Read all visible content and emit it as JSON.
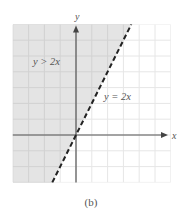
{
  "chart_data": {
    "type": "line",
    "title": "",
    "caption": "(b)",
    "xlabel": "x",
    "ylabel": "y",
    "xlim": [
      -4,
      6
    ],
    "ylim": [
      -3,
      7
    ],
    "grid": true,
    "grid_step": 1,
    "series": [
      {
        "name": "y = 2x",
        "style": "dashed",
        "color": "#222222",
        "points": [
          [
            -1.5,
            -3
          ],
          [
            3.5,
            7
          ]
        ]
      }
    ],
    "shaded_region": {
      "label": "y > 2x",
      "description": "region above (left of) the boundary line",
      "fill": "#e4e4e4",
      "boundary_inclusive": false
    },
    "annotations": [
      {
        "text": "y > 2x",
        "x": -2.5,
        "y": 4.7
      },
      {
        "text": "y = 2x",
        "x": 2.6,
        "y": 2.4
      }
    ]
  },
  "labels": {
    "x_axis": "x",
    "y_axis": "y",
    "inequality": "y > 2x",
    "equation": "y = 2x",
    "caption": "(b)"
  },
  "colors": {
    "shade": "#e4e4e4",
    "grid_shaded": "#d2d2d2",
    "grid_plain": "#e6e6e6",
    "axis": "#555555",
    "line": "#222222",
    "text": "#555555"
  }
}
